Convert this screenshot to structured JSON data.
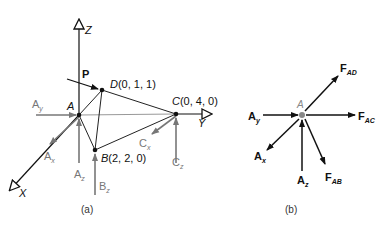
{
  "figure_a": {
    "caption": "(a)",
    "axes": {
      "z": "Z",
      "y": "Y",
      "x": "X"
    },
    "points": {
      "A": {
        "label": "A"
      },
      "B": {
        "label": "B",
        "coords": "(2, 2, 0)"
      },
      "C": {
        "label": "C",
        "coords": "(0, 4, 0)"
      },
      "D": {
        "label": "D",
        "coords": "(0, 1, 1)"
      }
    },
    "load": {
      "label": "P"
    },
    "reactions": {
      "Ay": {
        "main": "A",
        "sub": "y"
      },
      "Ax": {
        "main": "A",
        "sub": "x"
      },
      "Az": {
        "main": "A",
        "sub": "z"
      },
      "Bz": {
        "main": "B",
        "sub": "z"
      },
      "Cx": {
        "main": "C",
        "sub": "x"
      },
      "Cz": {
        "main": "C",
        "sub": "z"
      }
    }
  },
  "figure_b": {
    "caption": "(b)",
    "node": "A",
    "forces": {
      "Ay": {
        "main": "A",
        "sub": "y"
      },
      "Ax": {
        "main": "A",
        "sub": "x"
      },
      "Az": {
        "main": "A",
        "sub": "z"
      },
      "FAD": {
        "main": "F",
        "sub": "AD"
      },
      "FAC": {
        "main": "F",
        "sub": "AC"
      },
      "FAB": {
        "main": "F",
        "sub": "AB"
      }
    }
  },
  "colors": {
    "member": "#222222",
    "reaction": "#777777",
    "force": "#111111",
    "label_gray": "#888888"
  }
}
